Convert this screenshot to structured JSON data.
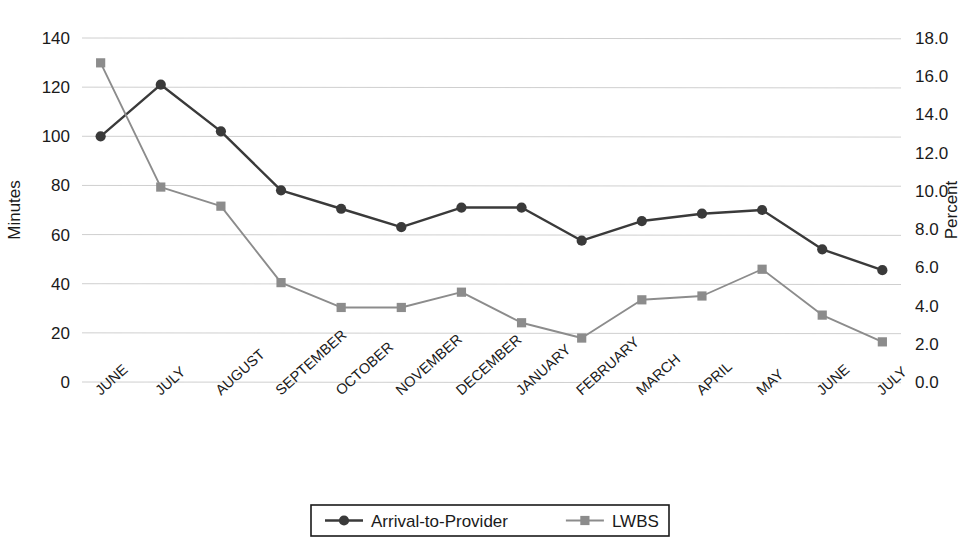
{
  "chart_data": {
    "type": "line",
    "title": "",
    "categories": [
      "JUNE",
      "JULY",
      "AUGUST",
      "SEPTEMBER",
      "OCTOBER",
      "NOVEMBER",
      "DECEMBER",
      "JANUARY",
      "FEBRUARY",
      "MARCH",
      "APRIL",
      "MAY",
      "JUNE",
      "JULY"
    ],
    "series": [
      {
        "name": "Arrival-to-Provider",
        "axis": "left",
        "unit": "minutes",
        "marker": "circle",
        "color": "#3a3a3a",
        "values": [
          100,
          121,
          102,
          78,
          70.5,
          63,
          71,
          71,
          57.5,
          65.5,
          68.5,
          70,
          54,
          45.5
        ]
      },
      {
        "name": "LWBS",
        "axis": "right",
        "unit": "percent",
        "marker": "square",
        "color": "#8c8c8c",
        "values": [
          16.7,
          10.2,
          9.2,
          5.2,
          3.9,
          3.9,
          4.7,
          3.1,
          2.3,
          4.3,
          4.5,
          5.9,
          3.5,
          2.1
        ]
      }
    ],
    "xlabel": "",
    "ylabel": "Minutes",
    "y2label": "Percent",
    "ylim": [
      0,
      140
    ],
    "y2lim": [
      0.0,
      18.0
    ],
    "yticks": [
      "0",
      "20",
      "40",
      "60",
      "80",
      "100",
      "120",
      "140"
    ],
    "y2ticks": [
      "0.0",
      "2.0",
      "4.0",
      "6.0",
      "8.0",
      "10.0",
      "12.0",
      "14.0",
      "16.0",
      "18.0"
    ],
    "grid": true,
    "legend_position": "bottom"
  },
  "legend": {
    "items": [
      {
        "label": "Arrival-to-Provider",
        "marker": "circle-marker",
        "color": "#3a3a3a"
      },
      {
        "label": "LWBS",
        "marker": "square-marker",
        "color": "#8c8c8c"
      }
    ]
  },
  "axes": {
    "left_title": "Minutes",
    "right_title": "Percent"
  }
}
